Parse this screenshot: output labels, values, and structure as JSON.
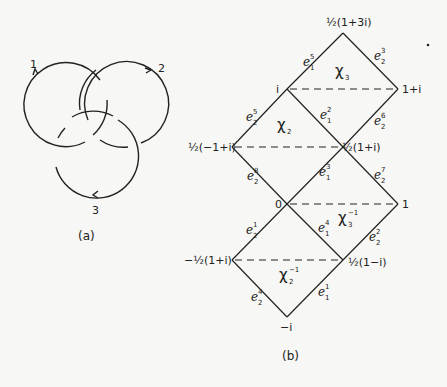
{
  "figure_a": {
    "caption": "(a)",
    "components": [
      {
        "label": "1",
        "cx": 66,
        "cy": 105,
        "r": 42
      },
      {
        "label": "2",
        "cx": 122,
        "cy": 105,
        "r": 42
      },
      {
        "label": "3",
        "cx": 94,
        "cy": 153,
        "r": 42
      }
    ]
  },
  "figure_b": {
    "caption": "(b)",
    "vertices": {
      "top": {
        "label": "½(1+3i)",
        "x": 343,
        "y": 33
      },
      "i": {
        "label": "i",
        "x": 287,
        "y": 89
      },
      "one_plus_i": {
        "label": "1+i",
        "x": 398,
        "y": 89
      },
      "half_neg1_plus_i": {
        "label": "½(−1+i)",
        "x": 232,
        "y": 147
      },
      "half_1_plus_i": {
        "label": "½(1+i)",
        "x": 343,
        "y": 147
      },
      "zero": {
        "label": "0",
        "x": 287,
        "y": 204
      },
      "one": {
        "label": "1",
        "x": 398,
        "y": 204
      },
      "neg_half_1_plus_i": {
        "label": "−½(1+i)",
        "x": 232,
        "y": 260
      },
      "half_1_minus_i": {
        "label": "½(1−i)",
        "x": 343,
        "y": 260
      },
      "neg_i": {
        "label": "−i",
        "x": 287,
        "y": 317
      }
    },
    "edges": [
      {
        "base": "e",
        "sub": "1",
        "sup": "5"
      },
      {
        "base": "e",
        "sub": "2",
        "sup": "3"
      },
      {
        "base": "e",
        "sub": "2",
        "sup": "5"
      },
      {
        "base": "e",
        "sub": "1",
        "sup": "2"
      },
      {
        "base": "e",
        "sub": "2",
        "sup": "6"
      },
      {
        "base": "e",
        "sub": "2",
        "sup": "8"
      },
      {
        "base": "e",
        "sub": "1",
        "sup": "3"
      },
      {
        "base": "e",
        "sub": "2",
        "sup": "7"
      },
      {
        "base": "e",
        "sub": "2",
        "sup": "1"
      },
      {
        "base": "e",
        "sub": "1",
        "sup": "4"
      },
      {
        "base": "e",
        "sub": "2",
        "sup": "2"
      },
      {
        "base": "e",
        "sub": "2",
        "sup": "4"
      },
      {
        "base": "e",
        "sub": "1",
        "sup": "1"
      }
    ],
    "regions": [
      {
        "base": "χ",
        "sub": "3",
        "sup": ""
      },
      {
        "base": "χ",
        "sub": "2",
        "sup": ""
      },
      {
        "base": "χ",
        "sub": "3",
        "sup": "−1"
      },
      {
        "base": "χ",
        "sub": "2",
        "sup": "−1"
      }
    ]
  }
}
